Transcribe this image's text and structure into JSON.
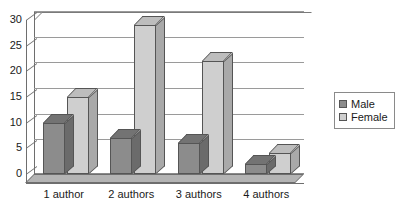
{
  "chart_data": {
    "type": "bar",
    "title": "",
    "xlabel": "",
    "ylabel": "",
    "categories": [
      "1 author",
      "2 authors",
      "3 authors",
      "4 authors"
    ],
    "series": [
      {
        "name": "Male",
        "values": [
          10,
          7,
          6,
          2
        ],
        "color": "#8c8c8c"
      },
      {
        "name": "Female",
        "values": [
          15,
          29,
          22,
          4
        ],
        "color": "#cfcfcf"
      }
    ],
    "ylim": [
      0,
      30
    ],
    "yticks": [
      0,
      5,
      10,
      15,
      20,
      25,
      30
    ],
    "ytick_labels": [
      "0",
      "5",
      "10",
      "15",
      "20",
      "25",
      "30"
    ],
    "grid": "horizontal",
    "legend_position": "right",
    "style": "3d-column"
  },
  "legend": {
    "entries": [
      {
        "label": "Male"
      },
      {
        "label": "Female"
      }
    ]
  }
}
